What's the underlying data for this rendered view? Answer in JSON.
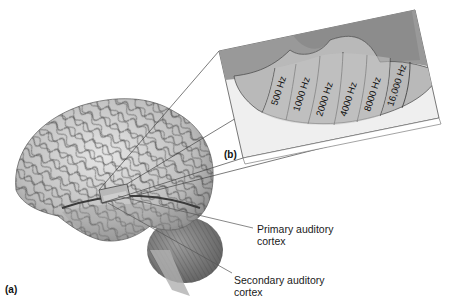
{
  "figure": {
    "panel_a_label": "(a)",
    "panel_b_label": "(b)",
    "callouts": {
      "primary": {
        "line1": "Primary auditory",
        "line2": "cortex"
      },
      "secondary": {
        "line1": "Secondary auditory",
        "line2": "cortex"
      }
    },
    "tonotopic_bands": [
      {
        "label": "500 Hz"
      },
      {
        "label": "1000 Hz"
      },
      {
        "label": "2000 Hz"
      },
      {
        "label": "4000 Hz"
      },
      {
        "label": "8000 Hz"
      },
      {
        "label": "16,000 Hz"
      }
    ],
    "colors": {
      "panel_face": "#ededed",
      "upper_cortex": "#9a9a9a",
      "auditory_region": "#b5b5b5",
      "band_fill": "#c2c2c2",
      "line": "#333333",
      "brain_light": "#d9d9d9",
      "brain_dark": "#5a5a5a"
    }
  }
}
